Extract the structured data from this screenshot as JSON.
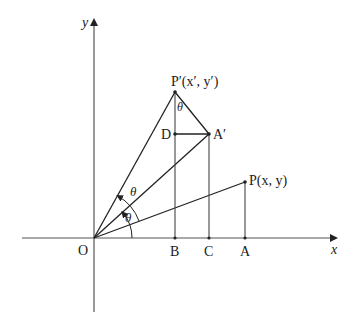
{
  "diagram": {
    "type": "rotation-of-point",
    "axes": {
      "x_label": "x",
      "y_label": "y",
      "origin_label": "O"
    },
    "points": {
      "P": {
        "label": "P(x, y)"
      },
      "P_prime": {
        "label": "P′(x′, y′)"
      },
      "A_prime": {
        "label": "A′"
      },
      "D": {
        "label": "D"
      },
      "A": {
        "label": "A"
      },
      "B": {
        "label": "B"
      },
      "C": {
        "label": "C"
      }
    },
    "angles": {
      "theta_1": "θ",
      "theta_2": "θ",
      "theta_at_P_prime": "θ"
    },
    "colors": {
      "line": "#222222",
      "axis": "#555555",
      "background": "#ffffff"
    }
  }
}
